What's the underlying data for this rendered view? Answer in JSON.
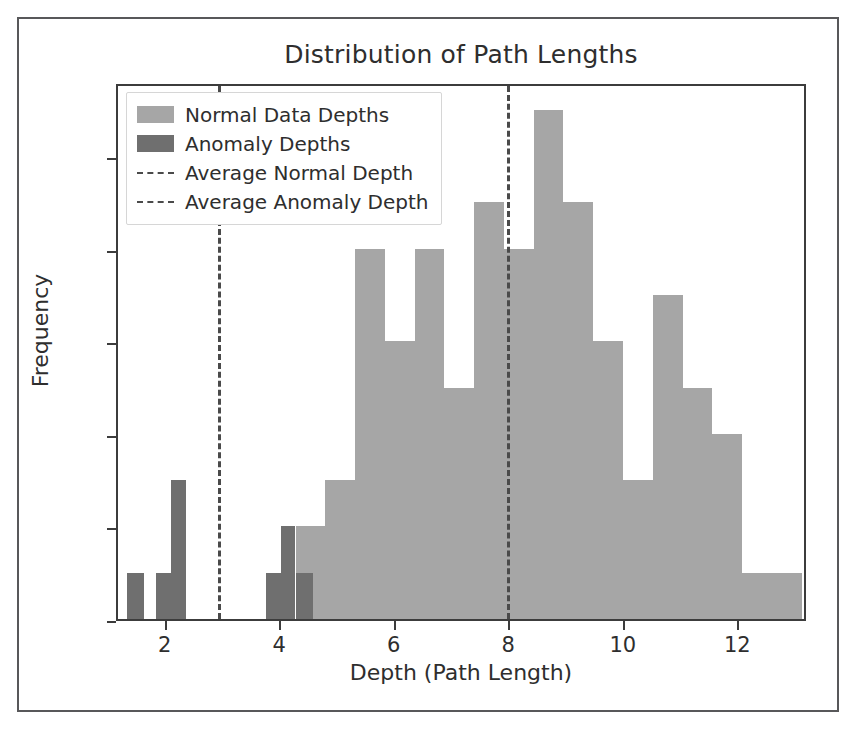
{
  "chart_data": {
    "type": "bar",
    "title": "Distribution of Path Lengths",
    "xlabel": "Depth (Path Length)",
    "ylabel": "Frequency",
    "xlim": [
      1.15,
      13.2
    ],
    "ylim": [
      0,
      11.6
    ],
    "grid": false,
    "legend_position": "upper left",
    "xticks": [
      "2",
      "4",
      "6",
      "8",
      "10",
      "12"
    ],
    "xtick_values": [
      2,
      4,
      6,
      8,
      10,
      12
    ],
    "yticks": [
      "0",
      "2",
      "4",
      "6",
      "8",
      "10"
    ],
    "ytick_values": [
      0,
      2,
      4,
      6,
      8,
      10
    ],
    "bin_width": 0.52,
    "series": [
      {
        "name": "Normal Data Depths",
        "color": "#a6a6a6",
        "bin_starts": [
          4.25,
          4.77,
          5.29,
          5.81,
          6.33,
          6.85,
          7.37,
          7.89,
          8.41,
          8.93,
          9.45,
          9.97,
          10.49,
          11.01,
          11.53,
          12.05,
          12.57
        ],
        "values": [
          2,
          3,
          8,
          6,
          8,
          5,
          9,
          8,
          11,
          9,
          6,
          3,
          7,
          5,
          4,
          1,
          1
        ]
      },
      {
        "name": "Anomaly Depths",
        "color": "#6f6f6f",
        "bin_starts": [
          1.3,
          1.82,
          2.08,
          2.6,
          3.73,
          3.99,
          4.25
        ],
        "bin_widths": [
          0.3,
          0.26,
          0.26,
          0.0,
          0.26,
          0.26,
          0.3
        ],
        "values": [
          1,
          1,
          3,
          0,
          1,
          2,
          1
        ]
      }
    ],
    "vlines": [
      {
        "name": "Average Normal Depth",
        "x": 7.95,
        "style": "dashed",
        "color": "#4a4a4a"
      },
      {
        "name": "Average Anomaly Depth",
        "x": 2.89,
        "style": "dashed",
        "color": "#4a4a4a"
      }
    ],
    "legend_entries": [
      {
        "label": "Normal Data Depths",
        "marker": "patch",
        "color": "#a6a6a6"
      },
      {
        "label": "Anomaly Depths",
        "marker": "patch",
        "color": "#6f6f6f"
      },
      {
        "label": "Average Normal Depth",
        "marker": "dashed-line",
        "color": "#4a4a4a"
      },
      {
        "label": "Average Anomaly Depth",
        "marker": "dashed-line",
        "color": "#4a4a4a"
      }
    ]
  }
}
